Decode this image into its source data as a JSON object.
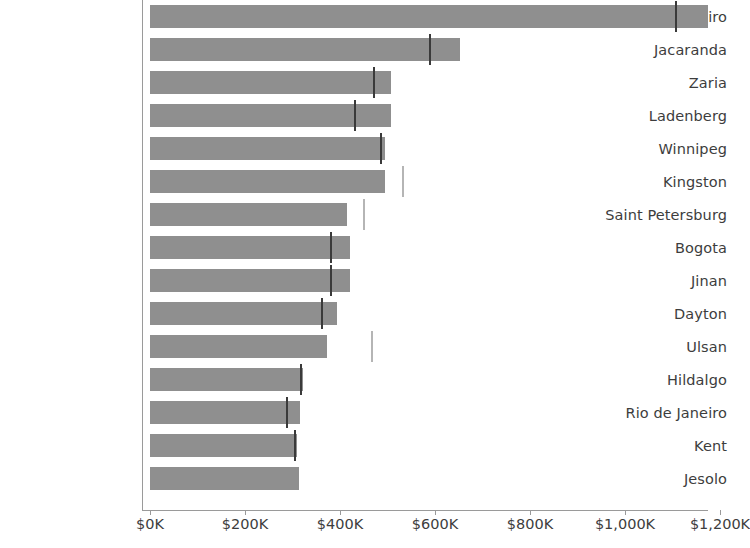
{
  "chart_data": {
    "type": "bar",
    "orientation": "horizontal",
    "title": "",
    "xlabel": "",
    "ylabel": "",
    "xlim": [
      0,
      1250
    ],
    "grid": false,
    "legend": null,
    "axis_tick_labels": [
      "$0K",
      "$200K",
      "$400K",
      "$600K",
      "$800K",
      "$1,000K",
      "$1,200K"
    ],
    "axis_tick_values": [
      0,
      200,
      400,
      600,
      800,
      1000,
      1200
    ],
    "value_unit": "thousands of dollars",
    "categories": [
      "Rio de Janeiro",
      "Jacaranda",
      "Zaria",
      "Ladenberg",
      "Winnipeg",
      "Kingston",
      "Saint Petersburg",
      "Bogota",
      "Jinan",
      "Dayton",
      "Ulsan",
      "Hildalgo",
      "Rio de Janeiro",
      "Kent",
      "Jesolo"
    ],
    "values": [
      1175,
      653,
      507,
      507,
      495,
      495,
      415,
      421,
      421,
      394,
      373,
      322,
      316,
      310,
      314
    ],
    "reference_markers": [
      1107,
      590,
      471,
      431,
      486,
      533,
      451,
      381,
      381,
      362,
      467,
      318,
      288,
      305,
      null
    ],
    "series": [
      {
        "name": "Value",
        "values": [
          1175,
          653,
          507,
          507,
          495,
          495,
          415,
          421,
          421,
          394,
          373,
          322,
          316,
          310,
          314
        ],
        "color": "#8f8f8f"
      },
      {
        "name": "Reference",
        "values": [
          1107,
          590,
          471,
          431,
          486,
          533,
          451,
          381,
          381,
          362,
          467,
          318,
          288,
          305,
          null
        ],
        "color": "#3a3a3a",
        "render": "tick-marker"
      }
    ]
  },
  "colors": {
    "bar_fill": "#8f8f8f",
    "reference_tick": "#3a3a3a",
    "reference_tick_outside": "#b5b5b5",
    "axis_line": "#9a9a9a",
    "text": "#3d3d3d",
    "background": "#ffffff"
  }
}
